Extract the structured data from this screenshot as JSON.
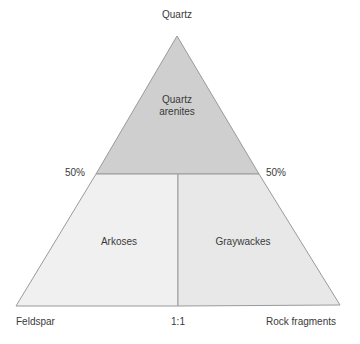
{
  "diagram": {
    "vertices": {
      "top": "Quartz",
      "bottom_left": "Feldspar",
      "bottom_right": "Rock fragments"
    },
    "bottom_ratio_label": "1:1",
    "left_percent_label": "50%",
    "right_percent_label": "50%",
    "regions": [
      {
        "name": "Quartz arenites",
        "line1": "Quartz",
        "line2": "arenites",
        "fill": "#cfcfcf"
      },
      {
        "name": "Arkoses",
        "label": "Arkoses",
        "fill": "#f0f0f0"
      },
      {
        "name": "Graywackes",
        "label": "Graywackes",
        "fill": "#e8e8e8"
      }
    ],
    "colors": {
      "outline": "#9a9a9a",
      "text": "#3a3a3a"
    }
  }
}
